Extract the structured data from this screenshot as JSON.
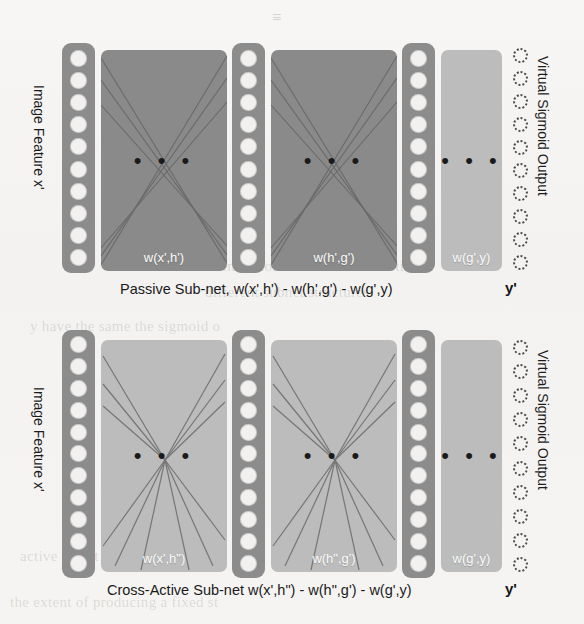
{
  "figure": {
    "type": "diagram",
    "colors": {
      "node_column_top": "#8c8c8c",
      "node_column_bottom": "#8c8c8c",
      "weight_block_top": "#8a8a8a",
      "weight_block_top_last": "#b9b9b9",
      "weight_block_bottom": "#b9b9b9",
      "node_fill": "#f2f1ef",
      "connection_line": "#5a5a5a",
      "dot": "#1a1a1a",
      "text": "#1a1a1a",
      "background": "#f4f3f1"
    }
  },
  "panels": [
    {
      "id": "passive",
      "left_label": "Image Feature x'",
      "right_label": "Virtual Sigmoid Output",
      "caption": "Passive Sub-net, w(x',h') - w(h',g') - w(g',y)",
      "output_symbol": "y'",
      "node_count": 10,
      "output_node_count": 10,
      "ellipsis": "• • •",
      "weight_blocks": [
        {
          "label": "w(x',h')",
          "shade": "dark",
          "lines": 6
        },
        {
          "label": "w(h',g')",
          "shade": "dark",
          "lines": 6
        },
        {
          "label": "w(g',y)",
          "shade": "light",
          "lines": 0
        }
      ]
    },
    {
      "id": "cross-active",
      "left_label": "Image Feature x'",
      "right_label": "Virtual Sigmoid Output",
      "caption": "Cross-Active Sub-net w(x',h\") - w(h\",g') - w(g',y)",
      "output_symbol": "y'",
      "node_count": 11,
      "output_node_count": 10,
      "ellipsis": "• • •",
      "weight_blocks": [
        {
          "label": "w(x',h\")",
          "shade": "light",
          "lines": 6
        },
        {
          "label": "w(h\",g')",
          "shade": "light",
          "lines": 6
        },
        {
          "label": "w(g',y)",
          "shade": "light",
          "lines": 0
        }
      ]
    }
  ],
  "page_bleedthrough": {
    "top_center": "≡",
    "lines": [
      "dimensions of all the x-directions",
      "different subnet structures.",
      "y have the same the sigmoid o",
      "active net. It is objected to bo",
      "the extent of producing a fixed st"
    ]
  }
}
